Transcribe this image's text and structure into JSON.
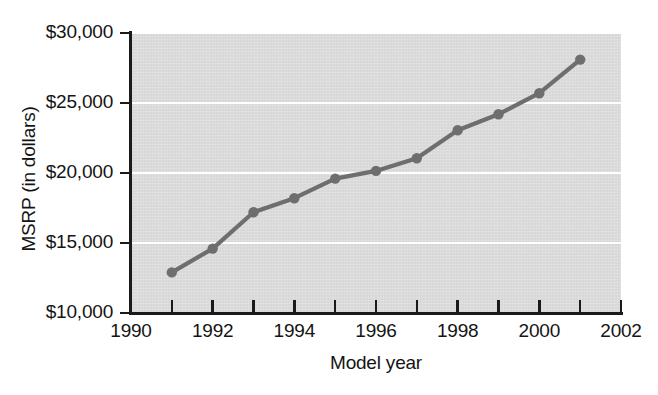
{
  "chart_data": {
    "type": "line",
    "title": "",
    "xlabel": "Model year",
    "ylabel": "MSRP (in dollars)",
    "x": [
      1991,
      1992,
      1993,
      1994,
      1995,
      1996,
      1997,
      1998,
      1999,
      2000,
      2001
    ],
    "values": [
      12900,
      14600,
      17200,
      18200,
      19600,
      20150,
      21050,
      23050,
      24200,
      25700,
      28100
    ],
    "series": [
      {
        "name": "MSRP",
        "values": [
          12900,
          14600,
          17200,
          18200,
          19600,
          20150,
          21050,
          23050,
          24200,
          25700,
          28100
        ]
      }
    ],
    "xlim": [
      1990,
      2002
    ],
    "ylim": [
      10000,
      30000
    ],
    "x_tick_interval": 1,
    "x_label_interval": 2,
    "y_tick_interval": 5000,
    "grid": "horizontal-white",
    "legend": "none",
    "x_tick_values": [
      1990,
      1991,
      1992,
      1993,
      1994,
      1995,
      1996,
      1997,
      1998,
      1999,
      2000,
      2001,
      2002
    ],
    "x_tick_labels": [
      "1990",
      "",
      "1992",
      "",
      "1994",
      "",
      "1996",
      "",
      "1998",
      "",
      "2000",
      "",
      "2002"
    ],
    "y_tick_values": [
      10000,
      15000,
      20000,
      25000,
      30000
    ],
    "y_tick_labels": [
      "$10,000",
      "$15,000",
      "$20,000",
      "$25,000",
      "$30,000"
    ],
    "colors": {
      "line": "#6e6e6e",
      "marker": "#6e6e6e",
      "plot_background": "#dcdcdc",
      "gridline": "#ffffff",
      "axis": "#1a1a1a",
      "text": "#141414",
      "page_background": "#ffffff"
    }
  }
}
